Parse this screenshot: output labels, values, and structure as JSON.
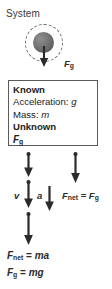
{
  "diagram": {
    "system": {
      "label": "System",
      "boundary_style": "dashed-circle",
      "object": "ball"
    },
    "gravity_vector": {
      "label_base": "F",
      "label_sub": "g",
      "direction": "down"
    },
    "info_box": {
      "known_heading": "Known",
      "known_items": [
        {
          "label": "Acceleration:",
          "symbol": "g"
        },
        {
          "label": "Mass:",
          "symbol": "m"
        }
      ],
      "unknown_heading": "Unknown",
      "unknown_symbol_base": "F",
      "unknown_symbol_sub": "g"
    },
    "motion": {
      "velocity_label": "v",
      "acceleration_label": "a",
      "velocity_arrow_count": 3
    },
    "net_force_relation": {
      "lhs_base": "F",
      "lhs_sub": "net",
      "operator": "=",
      "rhs_base": "F",
      "rhs_sub": "g"
    },
    "equations": [
      {
        "lhs_base": "F",
        "lhs_sub": "net",
        "operator": "=",
        "rhs": "ma"
      },
      {
        "lhs_base": "F",
        "lhs_sub": "g",
        "operator": "=",
        "rhs": "mg"
      }
    ],
    "colors": {
      "arrow": "#2b2b2b",
      "boundary": "#6b6b6b",
      "ball": "#6e6e6e",
      "box_border": "#5a5a5a",
      "text": "#2b2b2b"
    }
  }
}
